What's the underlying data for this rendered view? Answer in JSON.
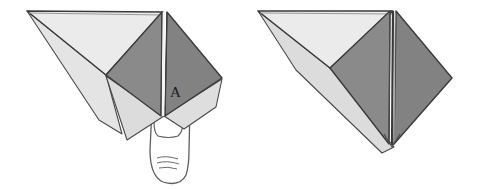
{
  "figure": {
    "background_color": "#ffffff",
    "colors": {
      "paper_light": "#ebebeb",
      "paper_light_alt": "#e2e2e2",
      "paper_shadow": "#d6d6d6",
      "paper_dark": "#8a8a8a",
      "paper_dark_alt": "#7e7e7e",
      "outline": "#3a3a3a",
      "outline_soft": "#5a5a5a",
      "hand_outline": "#5e5e5e",
      "label_text": "#1a1a1a"
    },
    "labels": {
      "point_a": "A"
    },
    "panels": [
      {
        "name": "left-panel",
        "caption": "",
        "has_hand": true,
        "has_point_label": true,
        "point_label": "A",
        "shapes": [
          {
            "name": "upper-left-light-triangle",
            "fill": "paper_light",
            "points": "27,11 163,12 106,75"
          },
          {
            "name": "left-lower-light-flap",
            "fill": "paper_light_alt",
            "points": "27,11 106,75 120,133 100,120"
          },
          {
            "name": "lower-light-wedge",
            "fill": "paper_shadow",
            "points": "106,76 164,116 126,139"
          },
          {
            "name": "right-lower-light-flap",
            "fill": "paper_shadow",
            "points": "164,116 222,79 215,106 183,128"
          },
          {
            "name": "dark-diamond-left-face",
            "fill": "paper_dark",
            "points": "106,75 163,12 161,116"
          },
          {
            "name": "dark-diamond-right-face",
            "fill": "paper_dark_alt",
            "points": "167,12 222,78 165,116"
          }
        ]
      },
      {
        "name": "right-panel",
        "caption": "",
        "has_hand": false,
        "has_point_label": false,
        "shapes": [
          {
            "name": "upper-left-light-triangle",
            "fill": "paper_light",
            "points": "258,11 393,11 330,68"
          },
          {
            "name": "lower-light-edge-band",
            "fill": "paper_shadow",
            "points": "258,11 330,68 392,145 383,152 300,72"
          },
          {
            "name": "dark-diamond-left-face",
            "fill": "paper_dark",
            "points": "330,68 391,11 389,144"
          },
          {
            "name": "dark-diamond-right-face",
            "fill": "paper_dark_alt",
            "points": "395,11 452,78 394,144"
          }
        ]
      }
    ],
    "hand": {
      "name": "holding-hand",
      "finger_outline": "#5e5e5e",
      "knuckle_lines": 3
    }
  }
}
